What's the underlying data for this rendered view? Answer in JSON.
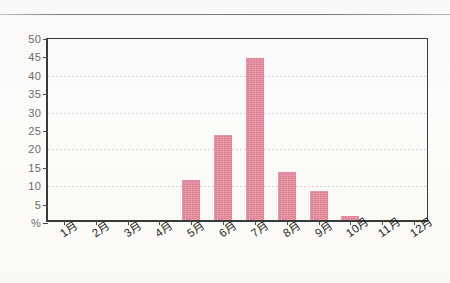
{
  "page": {
    "top_rule": "horizontal-rule"
  },
  "chart_data": {
    "type": "bar",
    "title": "",
    "subtitle": "",
    "xlabel": "",
    "ylabel": "%",
    "categories": [
      "1月",
      "2月",
      "3月",
      "4月",
      "5月",
      "6月",
      "7月",
      "8月",
      "9月",
      "10月",
      "11月",
      "12月"
    ],
    "values": [
      0,
      0,
      0,
      0,
      11,
      23,
      44,
      13,
      8,
      1,
      0,
      0
    ],
    "ylim": [
      0,
      50
    ],
    "ytick_labels": [
      "%",
      "5",
      "10",
      "15",
      "20",
      "25",
      "30",
      "35",
      "40",
      "45",
      "50"
    ],
    "ytick_values": [
      0,
      5,
      10,
      15,
      20,
      25,
      30,
      35,
      40,
      45,
      50
    ],
    "gridline_values": [
      10,
      20,
      30,
      40
    ],
    "grid": true,
    "legend": "none",
    "bar_color": "#e08397",
    "axis_color": "#3a3a3a",
    "grid_color": "#cfcfcf",
    "tick_label_color": "#6b6b6b",
    "category_label_color": "#2c2c2c",
    "label_rotation_deg": -35
  }
}
